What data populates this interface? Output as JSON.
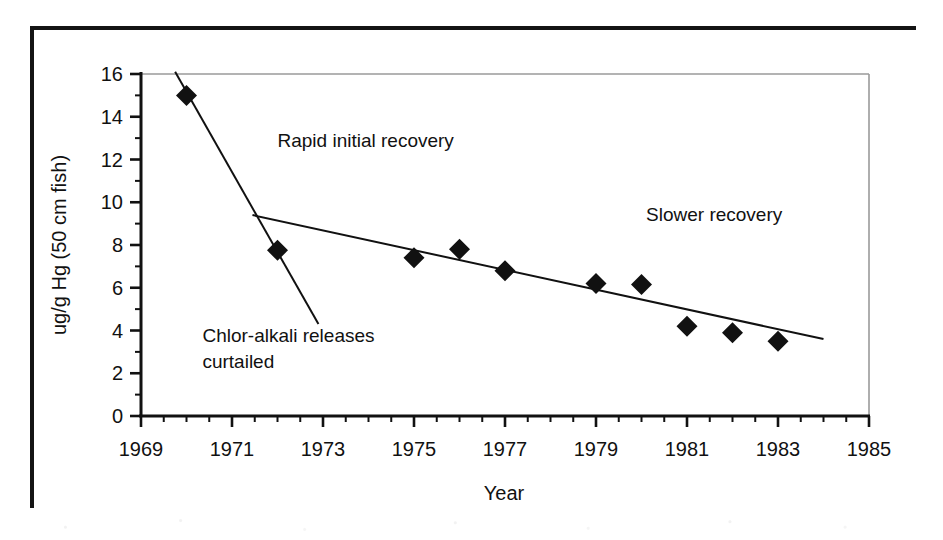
{
  "figure": {
    "background_color": "#ffffff",
    "frame_color": "#141414",
    "ink_color": "#111111"
  },
  "chart_data": {
    "type": "scatter",
    "title": "",
    "xlabel": "Year",
    "ylabel": "ug/g Hg (50 cm fish)",
    "xlim": [
      1969,
      1985
    ],
    "ylim": [
      0,
      16
    ],
    "xticks": [
      "1969",
      "1971",
      "1973",
      "1975",
      "1977",
      "1979",
      "1981",
      "1983",
      "1985"
    ],
    "xtick_values": [
      1969,
      1971,
      1973,
      1975,
      1977,
      1979,
      1981,
      1983,
      1985
    ],
    "xminor_step": 0.5,
    "yticks": [
      "0",
      "2",
      "4",
      "6",
      "8",
      "10",
      "12",
      "14",
      "16"
    ],
    "ytick_values": [
      0,
      2,
      4,
      6,
      8,
      10,
      12,
      14,
      16
    ],
    "yminor_step": 1,
    "grid": false,
    "legend": "none",
    "marker": "filled-diamond",
    "marker_color": "#111111",
    "series": [
      {
        "name": "Mercury in 50 cm fish",
        "x": [
          1970,
          1972,
          1975,
          1976,
          1977,
          1979,
          1980,
          1981,
          1982,
          1983
        ],
        "values": [
          15.0,
          7.75,
          7.4,
          7.8,
          6.8,
          6.2,
          6.15,
          4.2,
          3.9,
          3.5
        ]
      }
    ],
    "trend_lines": [
      {
        "name": "Rapid initial recovery",
        "x": [
          1969.75,
          1972.9
        ],
        "y": [
          16.1,
          4.3
        ]
      },
      {
        "name": "Slower recovery",
        "x": [
          1971.45,
          1984.0
        ],
        "y": [
          9.4,
          3.6
        ]
      }
    ],
    "annotations": [
      {
        "name": "rapid-initial-recovery",
        "text": "Rapid initial recovery",
        "x": 1972.0,
        "y": 12.6,
        "anchor": "start"
      },
      {
        "name": "slower-recovery",
        "text": "Slower recovery",
        "x": 1980.1,
        "y": 9.1,
        "anchor": "start"
      },
      {
        "name": "chlor-alkali-curtailed-line1",
        "text": "Chlor-alkali releases",
        "x": 1970.35,
        "y": 3.45,
        "anchor": "start"
      },
      {
        "name": "chlor-alkali-curtailed-line2",
        "text": "curtailed",
        "x": 1970.35,
        "y": 2.25,
        "anchor": "start"
      }
    ]
  }
}
